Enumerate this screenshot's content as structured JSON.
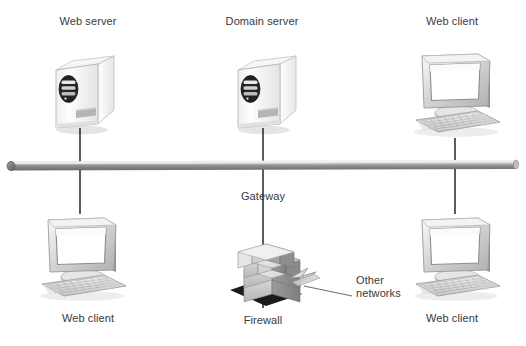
{
  "diagram": {
    "type": "network-topology",
    "background": "#ffffff",
    "palette": {
      "text": "#3a3a3a",
      "bus_light": "#e8e8e8",
      "bus_mid": "#9a9a9a",
      "bus_dark": "#6d6d6d",
      "cable": "#4a4a4a",
      "device_light": "#fbfbfb",
      "device_mid": "#d8d8d8",
      "device_dark": "#a8a8a8",
      "screen": "#ffffff",
      "brick_light": "#dcdcdc",
      "brick_mid": "#b4b4b4",
      "brick_dark": "#8e8e8e",
      "shadow": "#1e1e1e"
    }
  },
  "nodes": [
    {
      "id": "web-server",
      "label": "Web server",
      "icon": "server-tower-icon",
      "label_x": 88,
      "label_y": 22,
      "icon_x": 46,
      "icon_y": 48
    },
    {
      "id": "domain-server",
      "label": "Domain server",
      "icon": "server-tower-icon",
      "label_x": 262,
      "label_y": 22,
      "icon_x": 228,
      "icon_y": 48
    },
    {
      "id": "web-client-top-right",
      "label": "Web client",
      "icon": "desktop-computer-icon",
      "label_x": 452,
      "label_y": 22,
      "icon_x": 404,
      "icon_y": 46
    },
    {
      "id": "web-client-bottom-left",
      "label": "Web client",
      "icon": "desktop-computer-icon",
      "label_x": 88,
      "label_y": 318,
      "icon_x": 30,
      "icon_y": 210
    },
    {
      "id": "web-client-bottom-right",
      "label": "Web client",
      "icon": "desktop-computer-icon",
      "label_x": 452,
      "label_y": 318,
      "icon_x": 404,
      "icon_y": 210
    },
    {
      "id": "firewall",
      "label": "Firewall",
      "icon": "brick-wall-firewall-icon",
      "label_x": 263,
      "label_y": 320,
      "icon_x": 228,
      "icon_y": 236
    }
  ],
  "annotations": [
    {
      "id": "gateway",
      "label": "Gateway",
      "x": 263,
      "y": 196,
      "align": "center"
    },
    {
      "id": "other-networks",
      "label_line1": "Other",
      "label_line2": "networks",
      "x": 356,
      "y": 280,
      "align": "left"
    }
  ],
  "bus": {
    "name": "network-backbone-bus",
    "x1": 10,
    "x2": 516,
    "y": 166,
    "thickness": 9
  },
  "cables": [
    {
      "id": "cable-web-server",
      "x": 80,
      "y1": 131,
      "y2": 166
    },
    {
      "id": "cable-domain-server",
      "x": 263,
      "y1": 131,
      "y2": 166
    },
    {
      "id": "cable-client-topright",
      "x": 455,
      "y1": 140,
      "y2": 166
    },
    {
      "id": "cable-client-botleft",
      "x": 80,
      "y1": 166,
      "y2": 212
    },
    {
      "id": "cable-client-botright",
      "x": 455,
      "y1": 166,
      "y2": 212
    },
    {
      "id": "cable-firewall",
      "x": 263,
      "y1": 166,
      "y2": 306
    }
  ]
}
